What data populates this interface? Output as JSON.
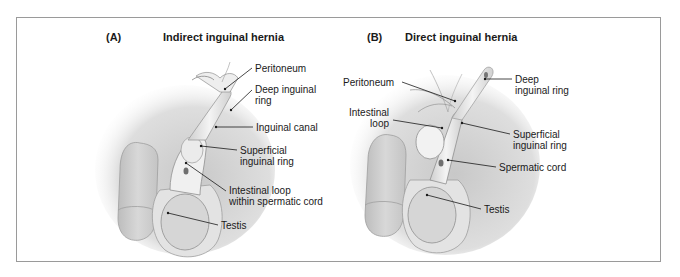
{
  "figure": {
    "panels": [
      {
        "letter": "(A)",
        "title": "Indirect inguinal hernia",
        "labels": [
          {
            "text": "Peritoneum"
          },
          {
            "text": "Deep inguinal\nring"
          },
          {
            "text": "Inguinal canal"
          },
          {
            "text": "Superficial\ninguinal ring"
          },
          {
            "text": "Intestinal loop\nwithin spermatic cord"
          },
          {
            "text": "Testis"
          }
        ]
      },
      {
        "letter": "(B)",
        "title": "Direct inguinal hernia",
        "labels": [
          {
            "text": "Peritoneum"
          },
          {
            "text": "Intestinal\nloop"
          },
          {
            "text": "Deep\ninguinal ring"
          },
          {
            "text": "Superficial\ninguinal ring"
          },
          {
            "text": "Spermatic cord"
          },
          {
            "text": "Testis"
          }
        ]
      }
    ],
    "colors": {
      "frame": "#9a9a9a",
      "skin_shade": "#c9c9c9",
      "structure_fill": "#e6e6e6",
      "leader_line": "#1a1a1a"
    }
  }
}
